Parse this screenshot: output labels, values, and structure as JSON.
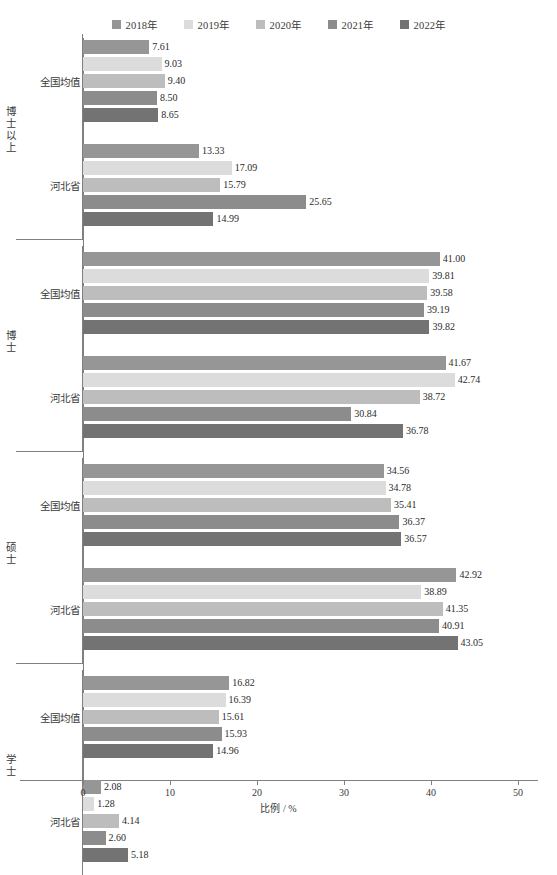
{
  "legend": {
    "items": [
      {
        "label": "2018年",
        "color": "#969696"
      },
      {
        "label": "2019年",
        "color": "#dcdcdc"
      },
      {
        "label": "2020年",
        "color": "#bdbdbd"
      },
      {
        "label": "2021年",
        "color": "#8c8c8c"
      },
      {
        "label": "2022年",
        "color": "#737373"
      }
    ]
  },
  "axis": {
    "x_title": "比例 / %",
    "x_ticks": [
      "0",
      "10",
      "20",
      "30",
      "40",
      "50"
    ],
    "x_min": 0,
    "x_max": 50
  },
  "groups": [
    {
      "name": "博士以上",
      "regions": [
        "全国均值",
        "河北省"
      ]
    },
    {
      "name": "博士",
      "regions": [
        "全国均值",
        "河北省"
      ]
    },
    {
      "name": "硕士",
      "regions": [
        "全国均值",
        "河北省"
      ]
    },
    {
      "name": "学士",
      "regions": [
        "全国均值",
        "河北省"
      ]
    }
  ],
  "chart_data": {
    "type": "bar",
    "orientation": "horizontal",
    "title": "",
    "xlabel": "比例 / %",
    "ylabel": "",
    "xlim": [
      0,
      50
    ],
    "grid": false,
    "legend_position": "top",
    "series": [
      {
        "name": "2018年",
        "color": "#969696"
      },
      {
        "name": "2019年",
        "color": "#dcdcdc"
      },
      {
        "name": "2020年",
        "color": "#bdbdbd"
      },
      {
        "name": "2021年",
        "color": "#8c8c8c"
      },
      {
        "name": "2022年",
        "color": "#737373"
      }
    ],
    "categories": [
      "博士以上 / 全国均值",
      "博士以上 / 河北省",
      "博士 / 全国均值",
      "博士 / 河北省",
      "硕士 / 全国均值",
      "硕士 / 河北省",
      "学士 / 全国均值",
      "学士 / 河北省"
    ],
    "values": {
      "博士以上 / 全国均值": [
        7.61,
        9.03,
        9.4,
        8.5,
        8.65
      ],
      "博士以上 / 河北省": [
        13.33,
        17.09,
        15.79,
        25.65,
        14.99
      ],
      "博士 / 全国均值": [
        41.0,
        39.81,
        39.58,
        39.19,
        39.82
      ],
      "博士 / 河北省": [
        41.67,
        42.74,
        38.72,
        30.84,
        36.78
      ],
      "硕士 / 全国均值": [
        34.56,
        34.78,
        35.41,
        36.37,
        36.57
      ],
      "硕士 / 河北省": [
        42.92,
        38.89,
        41.35,
        40.91,
        43.05
      ],
      "学士 / 全国均值": [
        16.82,
        16.39,
        15.61,
        15.93,
        14.96
      ],
      "学士 / 河北省": [
        2.08,
        1.28,
        4.14,
        2.6,
        5.18
      ]
    },
    "value_labels": {
      "博士以上 / 全国均值": [
        "7.61",
        "9.03",
        "9.40",
        "8.50",
        "8.65"
      ],
      "博士以上 / 河北省": [
        "13.33",
        "17.09",
        "15.79",
        "25.65",
        "14.99"
      ],
      "博士 / 全国均值": [
        "41.00",
        "39.81",
        "39.58",
        "39.19",
        "39.82"
      ],
      "博士 / 河北省": [
        "41.67",
        "42.74",
        "38.72",
        "30.84",
        "36.78"
      ],
      "硕士 / 全国均值": [
        "34.56",
        "34.78",
        "35.41",
        "36.37",
        "36.57"
      ],
      "硕士 / 河北省": [
        "42.92",
        "38.89",
        "41.35",
        "40.91",
        "43.05"
      ],
      "学士 / 全国均值": [
        "16.82",
        "16.39",
        "15.61",
        "15.93",
        "14.96"
      ],
      "学士 / 河北省": [
        "2.08",
        "1.28",
        "4.14",
        "2.60",
        "5.18"
      ]
    }
  }
}
